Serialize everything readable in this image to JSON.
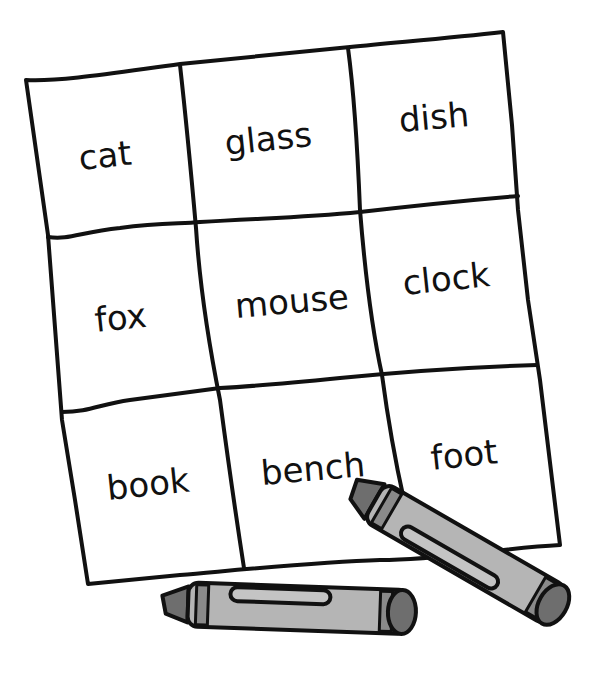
{
  "worksheet": {
    "grid": [
      [
        "cat",
        "glass",
        "dish"
      ],
      [
        "fox",
        "mouse",
        "clock"
      ],
      [
        "book",
        "bench",
        "foot"
      ]
    ]
  },
  "crayons": [
    {
      "name": "crayon-bottom",
      "body_color": "#b5b5b5",
      "tip_color": "#6e6e6e"
    },
    {
      "name": "crayon-right",
      "body_color": "#b5b5b5",
      "tip_color": "#6e6e6e"
    }
  ],
  "colors": {
    "outline": "#111111",
    "paper": "#ffffff",
    "crayon_body": "#b5b5b5",
    "crayon_dark": "#6e6e6e"
  }
}
